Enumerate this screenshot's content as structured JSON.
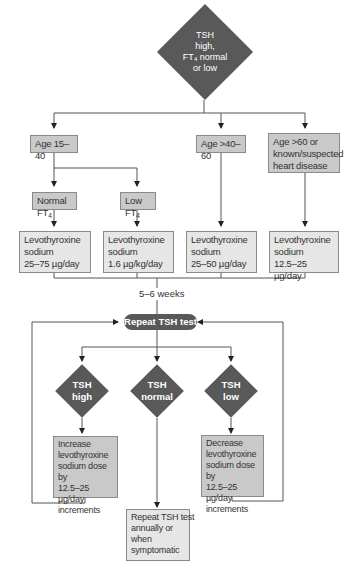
{
  "start": {
    "lines": [
      "TSH",
      "high,",
      "FT₄ normal",
      "or low"
    ]
  },
  "age_groups": [
    {
      "label": "Age 15–40"
    },
    {
      "label": "Age >40–60"
    },
    {
      "label": "Age >60 or known/suspected heart disease",
      "lines": [
        "Age >60 or",
        "known/suspected",
        "heart disease"
      ]
    }
  ],
  "ft4_branches": [
    {
      "label": "Normal FT",
      "sub": "4"
    },
    {
      "label": "Low FT",
      "sub": "4"
    }
  ],
  "doses": [
    {
      "lines": [
        "Levothyroxine",
        "sodium",
        "25–75 µg/day"
      ]
    },
    {
      "lines": [
        "Levothyroxine",
        "sodium",
        "1.6 µg/kg/day"
      ]
    },
    {
      "lines": [
        "Levothyroxine",
        "sodium",
        "25–50 µg/day"
      ]
    },
    {
      "lines": [
        "Levothyroxine",
        "sodium",
        "12.5–25 µg/day"
      ]
    }
  ],
  "interval": "5–6 weeks",
  "repeat_test": "Repeat TSH test",
  "outcomes": [
    {
      "lines": [
        "TSH",
        "high"
      ]
    },
    {
      "lines": [
        "TSH",
        "normal"
      ]
    },
    {
      "lines": [
        "TSH",
        "low"
      ]
    }
  ],
  "actions": {
    "increase": {
      "lines": [
        "Increase",
        "levothyroxine",
        "sodium dose by",
        "12.5–25 µg/day",
        "increments"
      ]
    },
    "monitor": {
      "lines": [
        "Repeat TSH test",
        "annually or",
        "when",
        "symptomatic"
      ]
    },
    "decrease": {
      "lines": [
        "Decrease",
        "levothyroxine",
        "sodium dose by",
        "12.5–25 µg/day",
        "increments"
      ]
    }
  },
  "colors": {
    "dark_node": "#595959",
    "box_dark": "#c9c9c9",
    "box_light": "#e6e6e6",
    "line": "#555555"
  }
}
